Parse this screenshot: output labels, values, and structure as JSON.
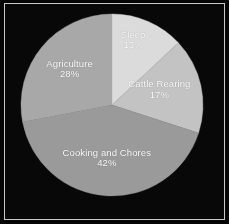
{
  "figure": {
    "background_color": "#070707",
    "border_color": "#c9c9c9",
    "label_color": "#ffffff"
  },
  "chart_data": {
    "type": "pie",
    "title": "",
    "subtitle": "",
    "xlabel": "",
    "ylabel": "",
    "legend_position": "none",
    "grid": false,
    "labels_inside_slices": true,
    "start_angle_deg": 0,
    "direction": "clockwise",
    "categories": [
      "Sleep",
      "Cattle Rearing",
      "Cooking and Chores",
      "Agriculture"
    ],
    "values": [
      13,
      17,
      42,
      28
    ],
    "value_unit": "%",
    "colors": [
      "#dcdcdc",
      "#c4c4c4",
      "#9a9a9a",
      "#a8a8a8"
    ],
    "slices": [
      {
        "name": "Sleep",
        "value": 13,
        "percent_text": "13%",
        "color": "#dcdcdc",
        "start_angle_deg": 0,
        "end_angle_deg": 46.8,
        "label_x_pct": 58.5,
        "label_y_pct": 17.0
      },
      {
        "name": "Cattle Rearing",
        "value": 17,
        "percent_text": "17%",
        "color": "#c4c4c4",
        "start_angle_deg": 46.8,
        "end_angle_deg": 108.0,
        "label_x_pct": 70.5,
        "label_y_pct": 40.0
      },
      {
        "name": "Cooking and Chores",
        "value": 42,
        "percent_text": "42%",
        "color": "#9a9a9a",
        "start_angle_deg": 108.0,
        "end_angle_deg": 259.2,
        "label_x_pct": 46.5,
        "label_y_pct": 72.0
      },
      {
        "name": "Agriculture",
        "value": 28,
        "percent_text": "28%",
        "color": "#a8a8a8",
        "start_angle_deg": 259.2,
        "end_angle_deg": 360.0,
        "label_x_pct": 29.5,
        "label_y_pct": 30.5
      }
    ]
  }
}
